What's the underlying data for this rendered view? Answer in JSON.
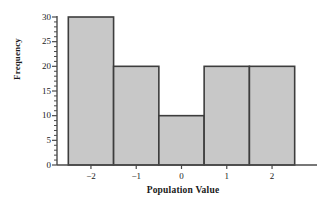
{
  "chart_data": {
    "type": "bar",
    "title": "",
    "subtitle": "",
    "xlabel": "Population Value",
    "ylabel": "Frequency",
    "categories": [
      "-2",
      "-1",
      "0",
      "1",
      "2"
    ],
    "values": [
      30,
      20,
      10,
      20,
      20
    ],
    "bin_edges": [
      -2.5,
      -1.5,
      -0.5,
      0.5,
      1.5,
      2.5
    ],
    "bin_width": 1,
    "xlim": [
      -2.75,
      2.75
    ],
    "ylim": [
      0,
      30
    ],
    "x_ticks": [
      "-2",
      "-1",
      "0",
      "1",
      "2"
    ],
    "x_tick_values": [
      -2,
      -1,
      0,
      1,
      2
    ],
    "y_ticks": [
      "0",
      "5",
      "10",
      "15",
      "20",
      "25",
      "30"
    ],
    "y_tick_values": [
      0,
      5,
      10,
      15,
      20,
      25,
      30
    ],
    "y_minor_tick_interval": 1,
    "grid": false,
    "legend": null,
    "legend_position": "none",
    "bar_fill_color": "#c8c8c8",
    "bar_edge_color": "#3d3d3d",
    "axis_color": "#4a4a4a",
    "text_color": "#1a1a1a"
  }
}
